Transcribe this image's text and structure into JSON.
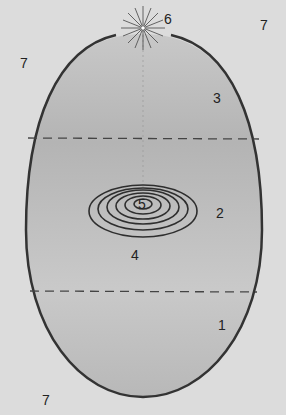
{
  "diagram": {
    "colors": {
      "background": "#dcdcdc",
      "ellipse_fill": "#bdbdbd",
      "outline": "#333333",
      "dash": "#444444",
      "spiral": "#2e2e2e"
    },
    "labels": [
      {
        "id": "region-1",
        "text": "1",
        "x": 218,
        "y": 325
      },
      {
        "id": "region-2",
        "text": "2",
        "x": 216,
        "y": 210
      },
      {
        "id": "region-3",
        "text": "3",
        "x": 213,
        "y": 93
      },
      {
        "id": "spiral-outer",
        "text": "4",
        "x": 131,
        "y": 250
      },
      {
        "id": "spiral-center",
        "text": "5",
        "x": 141,
        "y": 200
      },
      {
        "id": "star",
        "text": "6",
        "x": 164,
        "y": 14
      },
      {
        "id": "outside-top-right",
        "text": "7",
        "x": 260,
        "y": 18
      },
      {
        "id": "outside-left",
        "text": "7",
        "x": 20,
        "y": 57
      },
      {
        "id": "outside-bottom-left",
        "text": "7",
        "x": 42,
        "y": 393
      }
    ]
  }
}
